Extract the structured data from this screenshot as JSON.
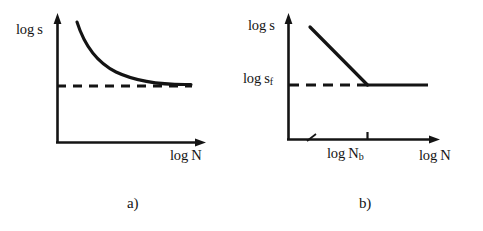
{
  "figure": {
    "type": "two-panel-line-diagram",
    "background_color": "#ffffff",
    "ink_color": "#141414",
    "panels": [
      {
        "id": "a",
        "caption": "a)",
        "y_axis_label": "log s",
        "x_axis_label": "log N",
        "description": "Monotonically decreasing convex curve approaching a horizontal dashed asymptote",
        "series": [
          {
            "name": "decaying-curve",
            "style": "solid",
            "points": [
              [
                77,
                22
              ],
              [
                84,
                33
              ],
              [
                92,
                44
              ],
              [
                101,
                54
              ],
              [
                111,
                62
              ],
              [
                122,
                69
              ],
              [
                134,
                75
              ],
              [
                147,
                79
              ],
              [
                160,
                82
              ],
              [
                175,
                84
              ],
              [
                190,
                84
              ]
            ]
          },
          {
            "name": "asymptote",
            "style": "dashed",
            "points": [
              [
                57,
                86
              ],
              [
                192,
                86
              ]
            ]
          }
        ],
        "axes": {
          "y_axis": [
            [
              57,
              143
            ],
            [
              57,
              16
            ]
          ],
          "x_axis": [
            [
              57,
              143
            ],
            [
              203,
              143
            ]
          ]
        }
      },
      {
        "id": "b",
        "caption": "b)",
        "y_axis_label": "log s",
        "y_tick_label_base": "log s",
        "y_tick_label_sub": "f",
        "x_axis_label": "log N",
        "x_tick_label_base": "log N",
        "x_tick_label_sub": "b",
        "description": "Straight descending line breaking to a horizontal plateau at the fatigue limit",
        "series": [
          {
            "name": "sloped-line",
            "style": "solid",
            "points": [
              [
                310,
                27
              ],
              [
                367,
                85
              ]
            ]
          },
          {
            "name": "plateau-line",
            "style": "solid",
            "points": [
              [
                367,
                85
              ],
              [
                428,
                85
              ]
            ]
          },
          {
            "name": "fatigue-limit-dashes",
            "style": "dashed",
            "points": [
              [
                289,
                85
              ],
              [
                367,
                85
              ]
            ]
          }
        ],
        "axes": {
          "y_axis": [
            [
              288,
              140
            ],
            [
              288,
              16
            ]
          ],
          "x_axis": [
            [
              288,
              140
            ],
            [
              438,
              140
            ]
          ]
        },
        "tick_marks": [
          {
            "name": "log-Nb-tick",
            "x": 367,
            "y": 140
          }
        ],
        "axis_break": {
          "name": "x-axis-break",
          "x": 312,
          "y": 140
        }
      }
    ]
  }
}
